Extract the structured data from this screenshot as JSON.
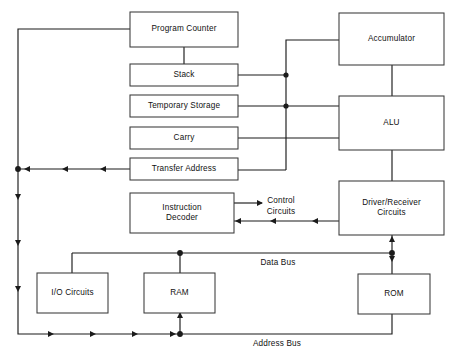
{
  "diagram": {
    "type": "block-diagram",
    "canvas": {
      "width": 456,
      "height": 363
    },
    "line_color": "#1b1b1b",
    "box_stroke_color": "#3a3a3a",
    "box_fill_color": "#ffffff",
    "background_color": "#ffffff",
    "blocks": [
      {
        "id": "program_counter",
        "label": "Program Counter",
        "x": 130,
        "y": 12,
        "w": 108,
        "h": 35
      },
      {
        "id": "stack",
        "label": "Stack",
        "x": 130,
        "y": 64,
        "w": 108,
        "h": 22
      },
      {
        "id": "temporary_storage",
        "label": "Temporary Storage",
        "x": 130,
        "y": 95,
        "w": 108,
        "h": 22
      },
      {
        "id": "carry",
        "label": "Carry",
        "x": 130,
        "y": 127,
        "w": 108,
        "h": 22
      },
      {
        "id": "transfer_address",
        "label": "Transfer Address",
        "x": 130,
        "y": 158,
        "w": 108,
        "h": 22
      },
      {
        "id": "instruction_decoder",
        "label": "Instruction\nDecoder",
        "x": 130,
        "y": 193,
        "w": 104,
        "h": 40
      },
      {
        "id": "accumulator",
        "label": "Accumulator",
        "x": 339,
        "y": 13,
        "w": 105,
        "h": 52
      },
      {
        "id": "alu",
        "label": "ALU",
        "x": 339,
        "y": 96,
        "w": 105,
        "h": 54
      },
      {
        "id": "driver_receiver",
        "label": "Driver/Receiver\nCircuits",
        "x": 339,
        "y": 181,
        "w": 105,
        "h": 54
      },
      {
        "id": "io_circuits",
        "label": "I/O Circuits",
        "x": 37,
        "y": 273,
        "w": 71,
        "h": 40
      },
      {
        "id": "ram",
        "label": "RAM",
        "x": 144,
        "y": 273,
        "w": 71,
        "h": 40
      },
      {
        "id": "rom",
        "label": "ROM",
        "x": 358,
        "y": 274,
        "w": 72,
        "h": 40
      }
    ],
    "free_labels": [
      {
        "id": "control_circuits",
        "label": "Control\nCircuits",
        "x": 255,
        "y": 196,
        "w": 52
      },
      {
        "id": "data_bus",
        "label": "Data Bus",
        "x": 248,
        "y": 258,
        "w": 60
      },
      {
        "id": "address_bus",
        "label": "Address Bus",
        "x": 240,
        "y": 339,
        "w": 74
      }
    ],
    "connections": [
      {
        "id": "pc-to-left-bus",
        "from": "program_counter",
        "to": "left-address-bus"
      },
      {
        "id": "pc-to-stack",
        "from": "program_counter",
        "to": "stack"
      },
      {
        "id": "stack-to-vertical-bus",
        "from": "stack",
        "to": "accumulator"
      },
      {
        "id": "temp-to-alu",
        "from": "temporary_storage",
        "to": "alu"
      },
      {
        "id": "carry-to-alu",
        "from": "carry",
        "to": "alu"
      },
      {
        "id": "transfer-to-vertical",
        "from": "transfer_address",
        "to": "accumulator"
      },
      {
        "id": "transfer-to-left-bus",
        "from": "transfer_address",
        "to": "left-address-bus"
      },
      {
        "id": "accumulator-to-alu",
        "from": "accumulator",
        "to": "alu"
      },
      {
        "id": "alu-to-driver",
        "from": "alu",
        "to": "driver_receiver"
      },
      {
        "id": "decoder-to-control",
        "from": "instruction_decoder",
        "to": "control_circuits"
      },
      {
        "id": "driver-to-decoder",
        "from": "driver_receiver",
        "to": "instruction_decoder"
      },
      {
        "id": "driver-to-data-bus",
        "from": "driver_receiver",
        "to": "data_bus"
      },
      {
        "id": "data-bus-to-io",
        "from": "data_bus",
        "to": "io_circuits"
      },
      {
        "id": "data-bus-to-ram",
        "from": "data_bus",
        "to": "ram"
      },
      {
        "id": "data-bus-to-rom",
        "from": "data_bus",
        "to": "rom"
      },
      {
        "id": "address-bus-to-ram",
        "from": "address_bus",
        "to": "ram"
      },
      {
        "id": "address-bus-to-rom",
        "from": "address_bus",
        "to": "rom"
      }
    ]
  }
}
